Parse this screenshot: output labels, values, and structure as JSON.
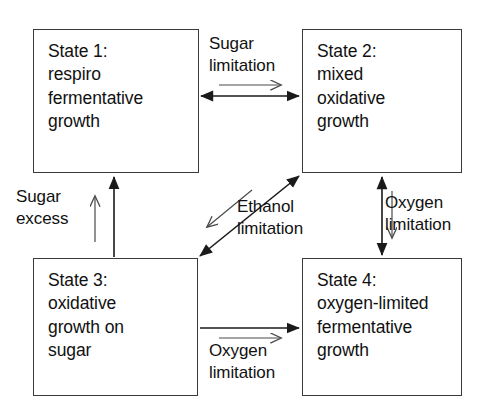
{
  "diagram": {
    "type": "state-transition-diagram",
    "background_color": "#ffffff",
    "line_color": "#1a1a1a",
    "text_color": "#111111",
    "states": [
      {
        "id": "state-1",
        "label": "State 1:\nrespiro\nfermentative\ngrowth",
        "position": "top-left"
      },
      {
        "id": "state-2",
        "label": "State 2:\nmixed\noxidative\ngrowth",
        "position": "top-right"
      },
      {
        "id": "state-3",
        "label": "State 3:\noxidative\ngrowth on\nsugar",
        "position": "bottom-left"
      },
      {
        "id": "state-4",
        "label": "State 4:\noxygen-limited\nfermentative\ngrowth",
        "position": "bottom-right"
      }
    ],
    "transitions": [
      {
        "id": "t-sugar-limitation",
        "label": "Sugar\nlimitation",
        "from": "state-1",
        "to": "state-2",
        "arrow_style": "double-headed",
        "direction_hint": "right"
      },
      {
        "id": "t-sugar-excess",
        "label": "Sugar\nexcess",
        "from": "state-3",
        "to": "state-1",
        "arrow_style": "single-headed",
        "direction_hint": "up"
      },
      {
        "id": "t-ethanol-limitation",
        "label": "Ethanol\nlimitation",
        "from": "state-2",
        "to": "state-3",
        "arrow_style": "double-headed",
        "direction_hint": "down-left"
      },
      {
        "id": "t-oxygen-limitation-right",
        "label": "Oxygen\nlimitation",
        "from": "state-2",
        "to": "state-4",
        "arrow_style": "double-headed",
        "direction_hint": "down"
      },
      {
        "id": "t-oxygen-limitation-bottom",
        "label": "Oxygen\nlimitation",
        "from": "state-3",
        "to": "state-4",
        "arrow_style": "single-headed",
        "direction_hint": "right"
      }
    ]
  }
}
